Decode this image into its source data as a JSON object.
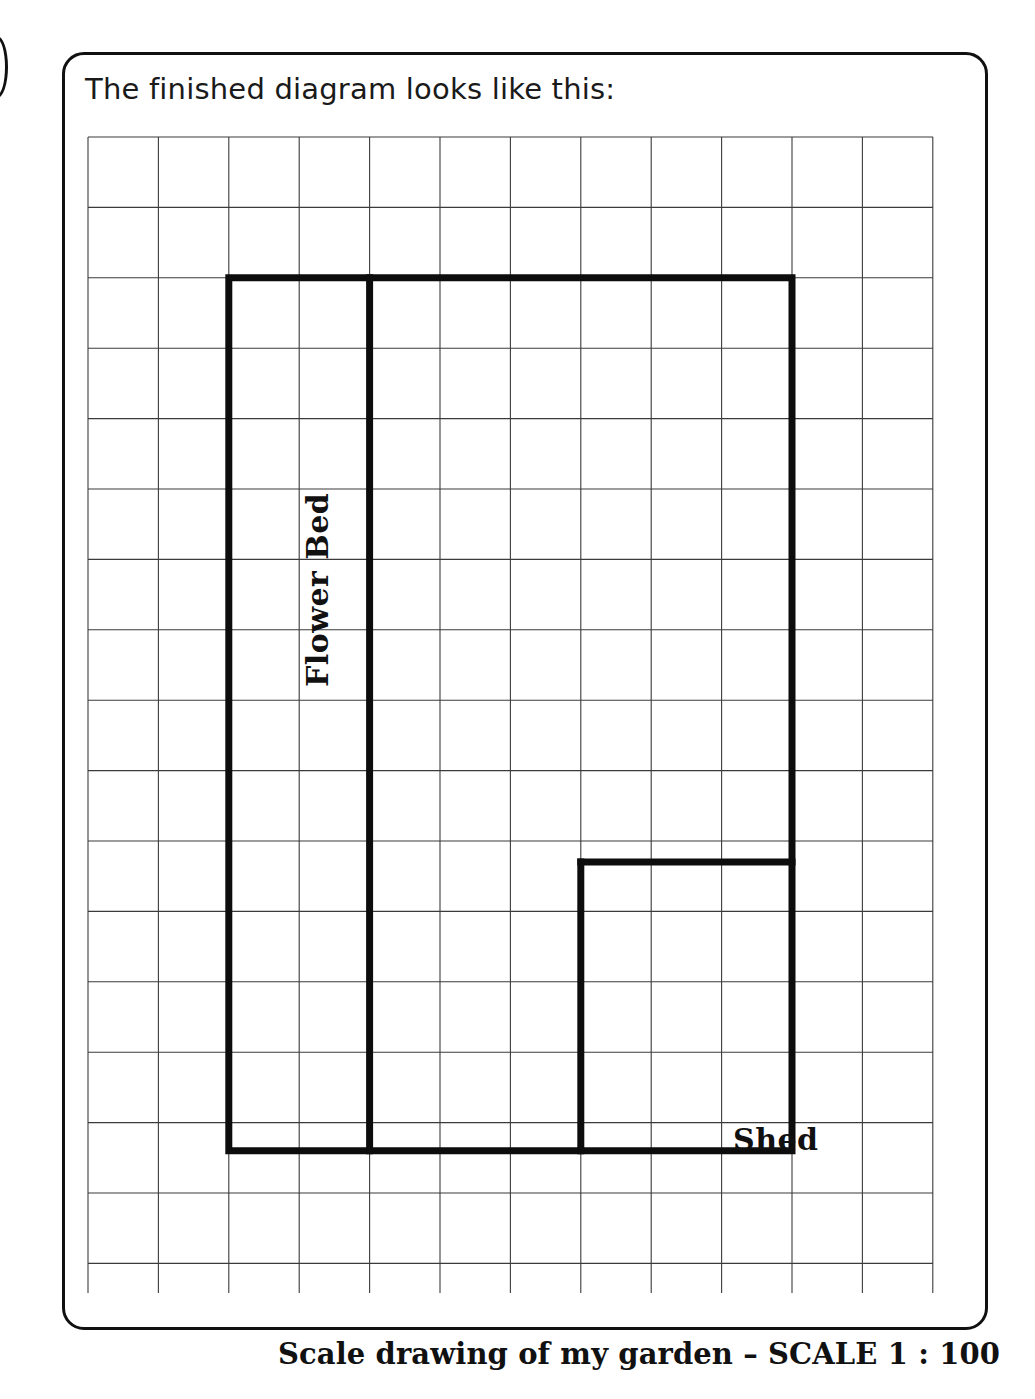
{
  "page": {
    "heading": "The finished diagram looks like this:",
    "caption": "Scale drawing of my garden – SCALE 1 : 100",
    "ink_color": "#111111",
    "grid_color": "#3b3b3b",
    "background": "#ffffff"
  },
  "labels": {
    "flower_bed": "Flower Bed",
    "shed": "Shed"
  },
  "diagram": {
    "type": "scale-drawing",
    "scale": "1 : 100",
    "grid": {
      "columns": 12,
      "rows": 16,
      "cell_size_px": 70.4,
      "origin_x_px": 0,
      "origin_y_px": 0,
      "width_px": 845,
      "height_px": 1156
    },
    "shapes": [
      {
        "name": "garden-outline",
        "kind": "polygon",
        "points_cells": [
          [
            2,
            2
          ],
          [
            10,
            2
          ],
          [
            10,
            14.4
          ],
          [
            2,
            14.4
          ]
        ],
        "closed": true
      },
      {
        "name": "flower-bed-divider",
        "kind": "line",
        "points_cells": [
          [
            4,
            2
          ],
          [
            4,
            14.4
          ]
        ],
        "closed": false
      },
      {
        "name": "shed-outline",
        "kind": "polyline",
        "points_cells": [
          [
            7,
            10.3
          ],
          [
            10,
            10.3
          ]
        ],
        "closed": false
      },
      {
        "name": "shed-left-edge",
        "kind": "line",
        "points_cells": [
          [
            7,
            10.3
          ],
          [
            7,
            14.4
          ]
        ],
        "closed": false
      }
    ]
  }
}
